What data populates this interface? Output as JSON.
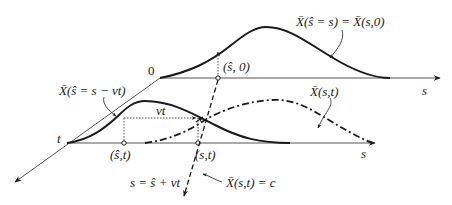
{
  "diagram": {
    "labels": {
      "origin": "0",
      "t_axis": "t",
      "s_axis_top": "s",
      "s_axis_bottom": "s",
      "point_top": "(ŝ, 0)",
      "point_bottom_left": "(ŝ,t)",
      "point_bottom_right": "(s,t)",
      "shift": "vt",
      "initial_profile": "X̄(ŝ = s) = X̄(s,0)",
      "shifted_profile": "X̄(ŝ = s − vt)",
      "evolved_profile": "X̄(s,t)",
      "characteristic_eq": "s = ŝ + vt",
      "characteristic_label": "X̄(s,t) = c"
    },
    "styles": {
      "stroke": "#1a1a1a",
      "axis": "#555555"
    }
  }
}
